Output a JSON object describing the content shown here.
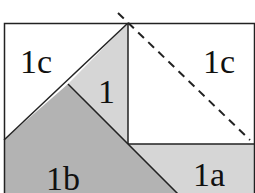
{
  "diagram": {
    "labels": {
      "top_left": "1c",
      "top_right": "1c",
      "center": "1",
      "bottom_left": "1b",
      "bottom_right": "1a"
    },
    "colors": {
      "background": "#ffffff",
      "light_gray": "#d6d6d6",
      "dark_gray": "#b3b3b3",
      "line": "#222222"
    }
  }
}
